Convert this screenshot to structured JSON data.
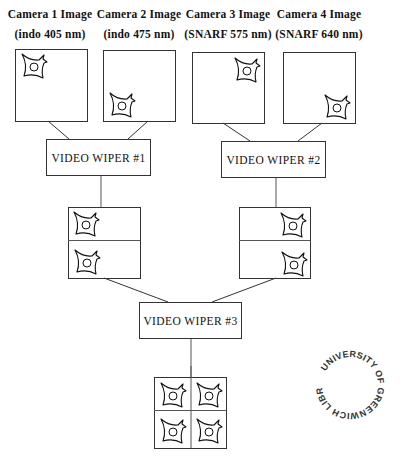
{
  "cameras": [
    {
      "title": "Camera 1 Image",
      "subtitle": "(indo 405 nm)",
      "cell_position": "top-left"
    },
    {
      "title": "Camera 2 Image",
      "subtitle": "(indo 475 nm)",
      "cell_position": "bottom-left"
    },
    {
      "title": "Camera 3 Image",
      "subtitle": "(SNARF 575 nm)",
      "cell_position": "top-right"
    },
    {
      "title": "Camera 4 Image",
      "subtitle": "(SNARF 640 nm)",
      "cell_position": "bottom-right"
    }
  ],
  "wipers": [
    {
      "label": "VIDEO WIPER #1"
    },
    {
      "label": "VIDEO WIPER #2"
    },
    {
      "label": "VIDEO WIPER #3"
    }
  ],
  "outputs": {
    "wiper1_output": "2-panel stack (left cells)",
    "wiper2_output": "2-panel stack (right cells)",
    "wiper3_output": "2x2 quad composite"
  },
  "stamp": {
    "text": "UNIVERSITY OF GREENWICH LIBRARY"
  },
  "colors": {
    "line": "#333333",
    "text": "#111111",
    "background": "#ffffff"
  }
}
